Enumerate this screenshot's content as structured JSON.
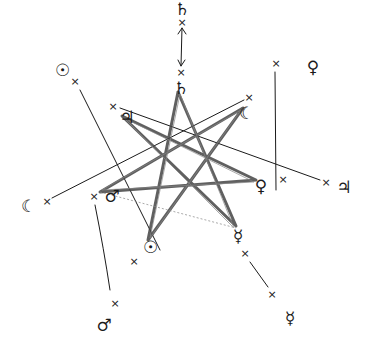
{
  "diagram": {
    "type": "heptagram",
    "style": "hand-drawn pencil sketch",
    "colors": {
      "ink": "#1a1a1a",
      "shading": "#555555",
      "faint": "#999999",
      "background": "#ffffff"
    },
    "planet_symbols": [
      {
        "id": "saturn_top",
        "symbol": "♄",
        "name": "Saturn",
        "x": 182,
        "y": 9
      },
      {
        "id": "saturn_inner",
        "symbol": "♄",
        "name": "Saturn",
        "x": 181,
        "y": 88
      },
      {
        "id": "sun_outer",
        "symbol": "☉",
        "name": "Sun",
        "x": 62,
        "y": 70
      },
      {
        "id": "jupiter_inner",
        "symbol": "♃",
        "name": "Jupiter",
        "x": 127,
        "y": 117
      },
      {
        "id": "moon_inner",
        "symbol": "☾",
        "name": "Moon",
        "x": 246,
        "y": 113
      },
      {
        "id": "venus_outer",
        "symbol": "♀",
        "name": "Venus",
        "x": 313,
        "y": 67
      },
      {
        "id": "venus_inner",
        "symbol": "♀",
        "name": "Venus",
        "x": 261,
        "y": 186
      },
      {
        "id": "jupiter_outer",
        "symbol": "♃",
        "name": "Jupiter",
        "x": 344,
        "y": 187
      },
      {
        "id": "moon_outer",
        "symbol": "☾",
        "name": "Moon",
        "x": 28,
        "y": 206
      },
      {
        "id": "mars_inner",
        "symbol": "♂",
        "name": "Mars",
        "x": 112,
        "y": 196
      },
      {
        "id": "sun_inner",
        "symbol": "☉",
        "name": "Sun",
        "x": 150,
        "y": 247
      },
      {
        "id": "mercury_inner",
        "symbol": "☿",
        "name": "Mercury",
        "x": 238,
        "y": 236
      },
      {
        "id": "mars_outer",
        "symbol": "♂",
        "name": "Mars",
        "x": 104,
        "y": 325
      },
      {
        "id": "mercury_outer",
        "symbol": "☿",
        "name": "Mercury",
        "x": 290,
        "y": 318
      }
    ],
    "cross_marks": [
      {
        "symbol": "×",
        "x": 182,
        "y": 22
      },
      {
        "symbol": "×",
        "x": 181,
        "y": 72
      },
      {
        "symbol": "×",
        "x": 75,
        "y": 81
      },
      {
        "symbol": "×",
        "x": 113,
        "y": 106
      },
      {
        "symbol": "×",
        "x": 249,
        "y": 97
      },
      {
        "symbol": "×",
        "x": 276,
        "y": 63
      },
      {
        "symbol": "×",
        "x": 283,
        "y": 179
      },
      {
        "symbol": "×",
        "x": 326,
        "y": 182
      },
      {
        "symbol": "×",
        "x": 47,
        "y": 201
      },
      {
        "symbol": "×",
        "x": 94,
        "y": 196
      },
      {
        "symbol": "×",
        "x": 134,
        "y": 261
      },
      {
        "symbol": "×",
        "x": 245,
        "y": 253
      },
      {
        "symbol": "×",
        "x": 272,
        "y": 294
      },
      {
        "symbol": "×",
        "x": 115,
        "y": 303
      }
    ]
  }
}
